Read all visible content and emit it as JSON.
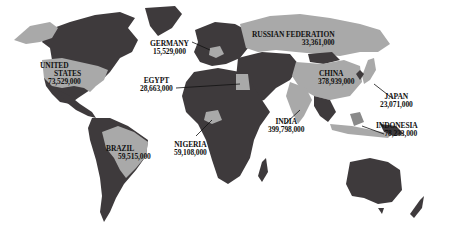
{
  "map": {
    "title": "",
    "colors": {
      "background": "#ffffff",
      "land": "#3e3a3c",
      "highlight": "#a9a9a9",
      "label_text": "#111111"
    },
    "countries": [
      {
        "name": "UNITED STATES",
        "name_line1": "UNITED",
        "name_line2": "STATES",
        "value": "73,529,000"
      },
      {
        "name": "GERMANY",
        "value": "15,529,000"
      },
      {
        "name": "EGYPT",
        "value": "28,663,000"
      },
      {
        "name": "RUSSIAN FEDERATION",
        "value": "33,361,000"
      },
      {
        "name": "CHINA",
        "value": "378,939,000"
      },
      {
        "name": "JAPAN",
        "value": "23,071,000"
      },
      {
        "name": "INDIA",
        "value": "399,798,000"
      },
      {
        "name": "INDONESIA",
        "value": "78,233,000"
      },
      {
        "name": "NIGERIA",
        "value": "59,108,000"
      },
      {
        "name": "BRAZIL",
        "value": "59,515,000"
      }
    ]
  }
}
